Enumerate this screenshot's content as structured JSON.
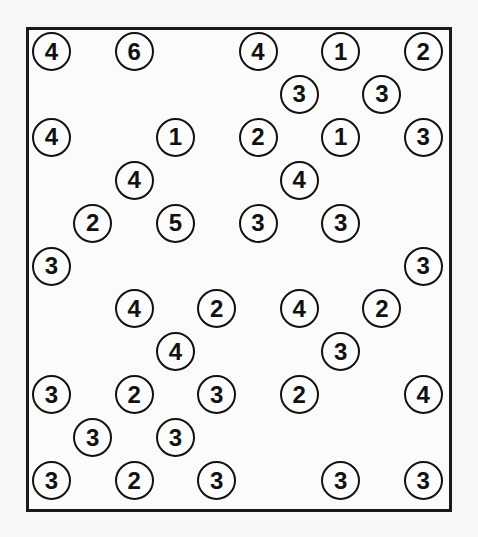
{
  "puzzle": {
    "type": "hashi",
    "rows": 11,
    "cols": 10,
    "colors": {
      "border": "#1a1a1a",
      "circle": "#111111",
      "background": "#fbfbfa"
    },
    "islands": [
      {
        "r": 0,
        "c": 0,
        "v": "4"
      },
      {
        "r": 0,
        "c": 2,
        "v": "6"
      },
      {
        "r": 0,
        "c": 5,
        "v": "4"
      },
      {
        "r": 0,
        "c": 7,
        "v": "1"
      },
      {
        "r": 0,
        "c": 9,
        "v": "2"
      },
      {
        "r": 1,
        "c": 6,
        "v": "3"
      },
      {
        "r": 1,
        "c": 8,
        "v": "3"
      },
      {
        "r": 2,
        "c": 0,
        "v": "4"
      },
      {
        "r": 2,
        "c": 3,
        "v": "1"
      },
      {
        "r": 2,
        "c": 5,
        "v": "2"
      },
      {
        "r": 2,
        "c": 7,
        "v": "1"
      },
      {
        "r": 2,
        "c": 9,
        "v": "3"
      },
      {
        "r": 3,
        "c": 2,
        "v": "4"
      },
      {
        "r": 3,
        "c": 6,
        "v": "4"
      },
      {
        "r": 4,
        "c": 1,
        "v": "2"
      },
      {
        "r": 4,
        "c": 3,
        "v": "5"
      },
      {
        "r": 4,
        "c": 5,
        "v": "3"
      },
      {
        "r": 4,
        "c": 7,
        "v": "3"
      },
      {
        "r": 5,
        "c": 0,
        "v": "3"
      },
      {
        "r": 5,
        "c": 9,
        "v": "3"
      },
      {
        "r": 6,
        "c": 2,
        "v": "4"
      },
      {
        "r": 6,
        "c": 4,
        "v": "2"
      },
      {
        "r": 6,
        "c": 6,
        "v": "4"
      },
      {
        "r": 6,
        "c": 8,
        "v": "2"
      },
      {
        "r": 7,
        "c": 3,
        "v": "4"
      },
      {
        "r": 7,
        "c": 7,
        "v": "3"
      },
      {
        "r": 8,
        "c": 0,
        "v": "3"
      },
      {
        "r": 8,
        "c": 2,
        "v": "2"
      },
      {
        "r": 8,
        "c": 4,
        "v": "3"
      },
      {
        "r": 8,
        "c": 6,
        "v": "2"
      },
      {
        "r": 8,
        "c": 9,
        "v": "4"
      },
      {
        "r": 9,
        "c": 1,
        "v": "3"
      },
      {
        "r": 9,
        "c": 3,
        "v": "3"
      },
      {
        "r": 10,
        "c": 0,
        "v": "3"
      },
      {
        "r": 10,
        "c": 2,
        "v": "2"
      },
      {
        "r": 10,
        "c": 4,
        "v": "3"
      },
      {
        "r": 10,
        "c": 7,
        "v": "3"
      },
      {
        "r": 10,
        "c": 9,
        "v": "3"
      }
    ]
  }
}
